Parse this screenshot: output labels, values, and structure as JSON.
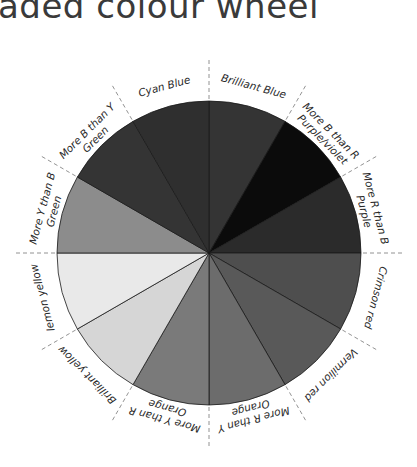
{
  "title": "aded colour wheel",
  "wheel": {
    "segments": [
      {
        "label": "Brilliant Blue",
        "shade": "#343434"
      },
      {
        "label": "More B than R Purple/violet",
        "shade": "#0b0b0b"
      },
      {
        "label": "More R than B Purple",
        "shade": "#2b2b2b"
      },
      {
        "label": "Crimson red",
        "shade": "#4e4e4e"
      },
      {
        "label": "Vermilion red",
        "shade": "#595959"
      },
      {
        "label": "More R than Y Orange",
        "shade": "#6c6c6c"
      },
      {
        "label": "More Y than R Orange",
        "shade": "#7a7a7a"
      },
      {
        "label": "Brilliant yellow",
        "shade": "#d6d6d6"
      },
      {
        "label": "lemon yellow",
        "shade": "#e9e9e9"
      },
      {
        "label": "More Y than B Green",
        "shade": "#8c8c8c"
      },
      {
        "label": "More B than Y Green",
        "shade": "#343434"
      },
      {
        "label": "Cyan Blue",
        "shade": "#2f2f2f"
      }
    ],
    "labels": {
      "l0": "Brilliant Blue",
      "l1a": "More B than R",
      "l1b": "Purple/violet",
      "l2a": "More R than B",
      "l2b": "Purple",
      "l3": "Crimson red",
      "l4": "Vermilion red",
      "l5a": "More R than Y",
      "l5b": "Orange",
      "l6a": "More Y than R",
      "l6b": "Orange",
      "l7": "Brilliant yellow",
      "l8": "lemon yellow",
      "l9a": "More Y than B",
      "l9b": "Green",
      "l10a": "More B than Y",
      "l10b": "Green",
      "l11": "Cyan Blue"
    }
  }
}
